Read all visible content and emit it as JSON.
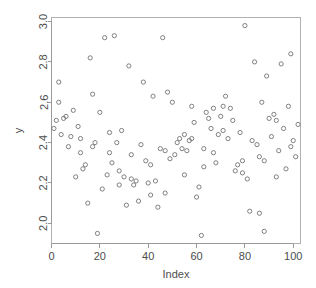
{
  "chart_data": {
    "type": "scatter",
    "title": "",
    "xlabel": "Index",
    "ylabel": "y",
    "xlim": [
      0,
      103
    ],
    "ylim": [
      1.9,
      3.02
    ],
    "grid": false,
    "legend": "none",
    "marker": "open-circle",
    "marker_color": "#737373",
    "frame_color": "#b0b0b0",
    "axis_color": "#9a9a9a",
    "text_color": "#4d4d4d",
    "background": "#ffffff",
    "xticks": [
      0,
      20,
      40,
      60,
      80,
      100
    ],
    "xtick_labels": [
      "0",
      "20",
      "40",
      "60",
      "80",
      "100"
    ],
    "yticks": [
      2.0,
      2.2,
      2.4,
      2.6,
      2.8,
      3.0
    ],
    "ytick_labels": [
      "2.0",
      "2.2",
      "2.4",
      "2.6",
      "2.8",
      "3.0"
    ],
    "n_points": 120,
    "x": [
      1,
      2,
      3,
      4,
      5,
      6,
      7,
      8,
      9,
      10,
      11,
      12,
      13,
      14,
      15,
      16,
      17,
      18,
      19,
      20,
      21,
      22,
      23,
      24,
      25,
      26,
      27,
      28,
      29,
      30,
      31,
      32,
      33,
      34,
      35,
      36,
      37,
      38,
      39,
      40,
      41,
      42,
      43,
      44,
      45,
      46,
      47,
      48,
      49,
      50,
      51,
      52,
      53,
      54,
      55,
      56,
      57,
      58,
      59,
      60,
      61,
      62,
      63,
      64,
      65,
      66,
      67,
      68,
      69,
      70,
      71,
      72,
      73,
      74,
      75,
      76,
      77,
      78,
      79,
      80,
      81,
      82,
      83,
      84,
      85,
      86,
      87,
      88,
      89,
      90,
      91,
      92,
      93,
      94,
      95,
      96,
      97,
      98,
      99,
      100,
      101,
      102,
      3,
      12,
      24,
      33,
      47,
      55,
      63,
      71,
      79,
      86,
      93,
      99,
      17,
      28,
      41,
      58,
      67,
      88
    ],
    "y": [
      2.47,
      2.51,
      2.7,
      2.44,
      2.52,
      2.53,
      2.38,
      2.43,
      2.56,
      2.23,
      2.48,
      2.35,
      2.27,
      2.29,
      2.1,
      2.82,
      2.38,
      2.4,
      1.95,
      2.55,
      2.17,
      2.92,
      2.24,
      2.35,
      2.3,
      2.93,
      2.4,
      2.26,
      2.46,
      2.23,
      2.09,
      2.78,
      2.34,
      2.19,
      2.21,
      2.11,
      2.39,
      2.7,
      2.31,
      2.2,
      2.29,
      2.63,
      2.21,
      2.08,
      2.37,
      2.92,
      2.36,
      2.65,
      2.32,
      2.6,
      2.34,
      2.4,
      2.42,
      2.37,
      2.24,
      2.36,
      2.41,
      2.58,
      2.5,
      2.13,
      2.18,
      1.94,
      2.37,
      2.55,
      2.52,
      2.47,
      2.57,
      2.3,
      2.44,
      2.53,
      2.58,
      2.63,
      2.42,
      2.57,
      2.51,
      2.26,
      2.29,
      2.45,
      2.31,
      2.98,
      2.22,
      2.06,
      2.41,
      2.8,
      2.39,
      2.05,
      2.6,
      1.96,
      2.73,
      2.52,
      2.43,
      2.54,
      2.23,
      2.36,
      2.79,
      2.47,
      2.27,
      2.58,
      2.84,
      2.41,
      2.33,
      2.49,
      2.6,
      2.42,
      2.45,
      2.22,
      2.15,
      2.44,
      2.28,
      2.46,
      2.25,
      2.33,
      2.51,
      2.38,
      2.64,
      2.19,
      2.14,
      2.42,
      2.35,
      2.31
    ]
  }
}
